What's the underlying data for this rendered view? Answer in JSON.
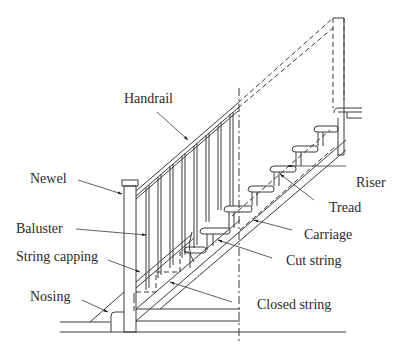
{
  "diagram": {
    "labels": {
      "handrail": "Handrail",
      "newel": "Newel",
      "baluster": "Baluster",
      "string_capping": "String capping",
      "nosing": "Nosing",
      "riser": "Riser",
      "tread": "Tread",
      "carriage": "Carriage",
      "cut_string": "Cut string",
      "closed_string": "Closed string"
    },
    "colors": {
      "line": "#3a3a3a",
      "text": "#2a2a2a",
      "background": "#ffffff"
    }
  }
}
